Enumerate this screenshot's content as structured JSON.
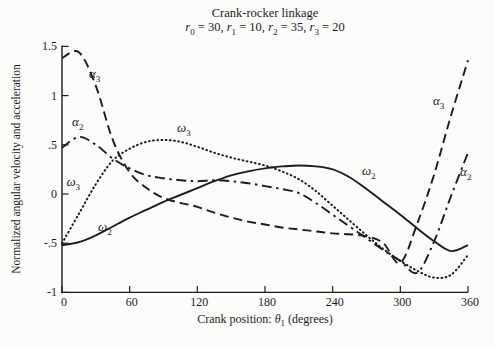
{
  "figure": {
    "background": "#fcfcfa",
    "ink_color": "#1b1b1b"
  },
  "chart_data": {
    "type": "line",
    "title": "Crank-rocker linkage",
    "subtitle": "r₀ = 30, r₁ = 10, r₂ = 35, r₃ = 20",
    "subtitle_params": [
      {
        "symbol": "r",
        "sub": "0",
        "value": "30"
      },
      {
        "symbol": "r",
        "sub": "1",
        "value": "10"
      },
      {
        "symbol": "r",
        "sub": "2",
        "value": "35"
      },
      {
        "symbol": "r",
        "sub": "3",
        "value": "20"
      }
    ],
    "xlabel": {
      "prefix": "Crank position:",
      "symbol": "θ",
      "sub": "1",
      "suffix": "(degrees)"
    },
    "ylabel": "Normalized angular velocity  and acceleration",
    "xlim": [
      0,
      360
    ],
    "ylim": [
      -1,
      1.5
    ],
    "grid": false,
    "legend": "inline-curve-labels",
    "xticks": [
      0,
      60,
      120,
      180,
      240,
      300,
      360
    ],
    "yticks": [
      {
        "value": 1.5,
        "label": "1.5"
      },
      {
        "value": 1,
        "label": "1"
      },
      {
        "value": 0.5,
        "label": ".5"
      },
      {
        "value": 0,
        "label": "0"
      },
      {
        "value": -0.5,
        "label": "-.5"
      },
      {
        "value": -1,
        "label": "-1"
      }
    ],
    "x": [
      0,
      15,
      30,
      45,
      60,
      75,
      90,
      105,
      120,
      135,
      150,
      165,
      180,
      195,
      210,
      225,
      240,
      255,
      270,
      285,
      300,
      315,
      330,
      345,
      360
    ],
    "series": [
      {
        "id": "omega2",
        "name": "ω₂",
        "style": "solid",
        "values": [
          -0.52,
          -0.49,
          -0.42,
          -0.33,
          -0.24,
          -0.16,
          -0.08,
          -0.01,
          0.06,
          0.13,
          0.19,
          0.23,
          0.26,
          0.28,
          0.29,
          0.28,
          0.25,
          0.17,
          0.05,
          -0.08,
          -0.21,
          -0.35,
          -0.48,
          -0.58,
          -0.52
        ]
      },
      {
        "id": "omega3",
        "name": "ω₃",
        "style": "dotted",
        "values": [
          -0.5,
          -0.2,
          0.1,
          0.34,
          0.46,
          0.53,
          0.55,
          0.53,
          0.48,
          0.42,
          0.37,
          0.33,
          0.29,
          0.23,
          0.15,
          0.03,
          -0.12,
          -0.27,
          -0.42,
          -0.56,
          -0.68,
          -0.78,
          -0.85,
          -0.82,
          -0.62
        ]
      },
      {
        "id": "alpha2",
        "name": "α₂",
        "style": "dashdot",
        "values": [
          0.47,
          0.58,
          0.5,
          0.36,
          0.26,
          0.19,
          0.16,
          0.14,
          0.13,
          0.14,
          0.13,
          0.11,
          0.08,
          0.05,
          0.01,
          -0.09,
          -0.21,
          -0.33,
          -0.45,
          -0.57,
          -0.68,
          -0.8,
          -0.48,
          -0.02,
          0.42
        ]
      },
      {
        "id": "alpha3",
        "name": "α₃",
        "style": "dashed",
        "values": [
          1.38,
          1.44,
          1.1,
          0.55,
          0.22,
          0.06,
          -0.04,
          -0.09,
          -0.13,
          -0.19,
          -0.24,
          -0.28,
          -0.31,
          -0.34,
          -0.36,
          -0.38,
          -0.4,
          -0.41,
          -0.43,
          -0.5,
          -0.7,
          -0.3,
          0.2,
          0.8,
          1.36
        ]
      }
    ],
    "curve_labels": [
      {
        "series": "alpha3",
        "symbol": "α",
        "sub": "3",
        "theta": 29,
        "value": 1.22
      },
      {
        "series": "alpha2",
        "symbol": "α",
        "sub": "2",
        "theta": 14,
        "value": 0.73
      },
      {
        "series": "omega3",
        "symbol": "ω",
        "sub": "3",
        "theta": 10,
        "value": 0.12
      },
      {
        "series": "omega2",
        "symbol": "ω",
        "sub": "2",
        "theta": 38,
        "value": -0.34
      },
      {
        "series": "omega3",
        "symbol": "ω",
        "sub": "3",
        "theta": 108,
        "value": 0.67
      },
      {
        "series": "omega2",
        "symbol": "ω",
        "sub": "2",
        "theta": 272,
        "value": 0.23
      },
      {
        "series": "alpha3",
        "symbol": "α",
        "sub": "3",
        "theta": 334,
        "value": 0.95
      },
      {
        "series": "alpha2",
        "symbol": "α",
        "sub": "2",
        "theta": 358,
        "value": 0.22
      }
    ]
  }
}
